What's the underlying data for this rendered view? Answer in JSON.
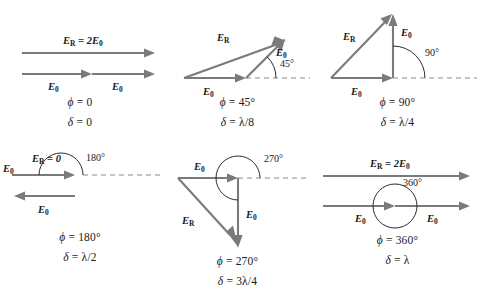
{
  "figure": {
    "colors": {
      "vector": "#7a7a7a",
      "axis_dashed": "#8a8a8a",
      "arc": "#2b2b2b",
      "text": "#1a1a1a",
      "background": "#ffffff"
    }
  },
  "panels": [
    {
      "id": "phi-0",
      "angle_label": "",
      "resultant_label": "E",
      "resultant_sub": "R",
      "resultant_expr": " = 2E",
      "resultant_expr_sub": "0",
      "component_label": "E",
      "component_sub": "0",
      "component_label_2": "E",
      "component_sub_2": "0",
      "caption_phi_symbol": "ϕ",
      "caption_phi_value": " = 0",
      "caption_delta_symbol": "δ",
      "caption_delta_value": " = 0"
    },
    {
      "id": "phi-45",
      "angle_label": "45°",
      "resultant_label": "E",
      "resultant_sub": "R",
      "component_label": "E",
      "component_sub": "0",
      "component_label_2": "E",
      "component_sub_2": "0",
      "caption_phi_symbol": "ϕ",
      "caption_phi_value": " = 45°",
      "caption_delta_symbol": "δ",
      "caption_delta_value": " = λ/8"
    },
    {
      "id": "phi-90",
      "angle_label": "90°",
      "resultant_label": "E",
      "resultant_sub": "R",
      "component_label": "E",
      "component_sub": "0",
      "component_label_2": "E",
      "component_sub_2": "0",
      "caption_phi_symbol": "ϕ",
      "caption_phi_value": " = 90°",
      "caption_delta_symbol": "δ",
      "caption_delta_value": " = λ/4"
    },
    {
      "id": "phi-180",
      "angle_label": "180°",
      "resultant_label": "E",
      "resultant_sub": "R",
      "resultant_expr": " = 0",
      "component_label": "E",
      "component_sub": "0",
      "component_label_2": "E",
      "component_sub_2": "0",
      "caption_phi_symbol": "ϕ",
      "caption_phi_value": " = 180°",
      "caption_delta_symbol": "δ",
      "caption_delta_value": " = λ/2"
    },
    {
      "id": "phi-270",
      "angle_label": "270°",
      "resultant_label": "E",
      "resultant_sub": "R",
      "component_label": "E",
      "component_sub": "0",
      "component_label_2": "E",
      "component_sub_2": "0",
      "caption_phi_symbol": "ϕ",
      "caption_phi_value": " = 270°",
      "caption_delta_symbol": "δ",
      "caption_delta_value": " = 3λ/4"
    },
    {
      "id": "phi-360",
      "angle_label": "360°",
      "resultant_label": "E",
      "resultant_sub": "R",
      "resultant_expr": " = 2E",
      "resultant_expr_sub": "0",
      "component_label": "E",
      "component_sub": "0",
      "component_label_2": "E",
      "component_sub_2": "0",
      "caption_phi_symbol": "ϕ",
      "caption_phi_value": " = 360°",
      "caption_delta_symbol": "δ",
      "caption_delta_value": " = λ"
    }
  ]
}
